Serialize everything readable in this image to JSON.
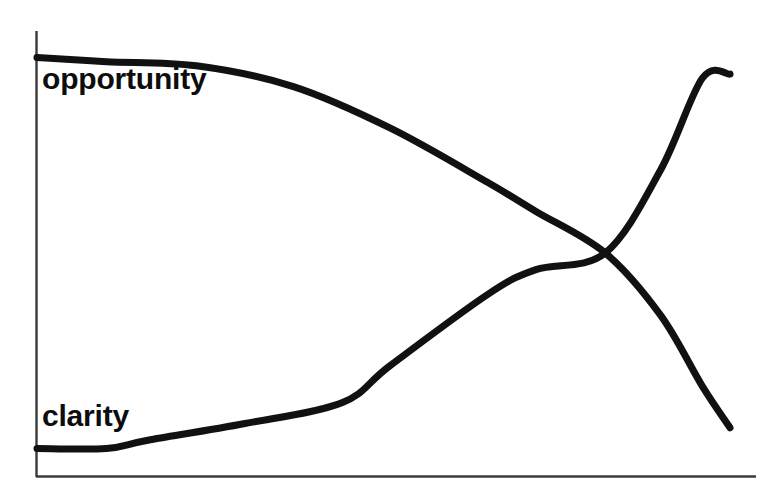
{
  "chart_data": {
    "type": "line",
    "title": "",
    "subtitle": "",
    "xlabel": "",
    "ylabel": "",
    "xlim": [
      0,
      100
    ],
    "ylim": [
      0,
      100
    ],
    "grid": false,
    "axes": {
      "x_axis_visible": true,
      "y_axis_visible": true,
      "tick_labels_x": [],
      "tick_labels_y": [],
      "axis_color": "#3a3a3a",
      "axis_width_px": 2
    },
    "legend": {
      "position": "inline-left",
      "entries": [
        "opportunity",
        "clarity"
      ]
    },
    "line_color": "#111111",
    "line_width_px": 7,
    "annotations": [
      {
        "name": "crossover-point",
        "x": 82,
        "y": 50,
        "label": ""
      }
    ],
    "series": [
      {
        "name": "opportunity",
        "label": "opportunity",
        "color": "#111111",
        "trend": "decreasing",
        "points": [
          {
            "x": 0,
            "y": 97
          },
          {
            "x": 10,
            "y": 96
          },
          {
            "x": 23,
            "y": 95
          },
          {
            "x": 37,
            "y": 90
          },
          {
            "x": 51,
            "y": 80
          },
          {
            "x": 65,
            "y": 67
          },
          {
            "x": 72,
            "y": 60
          },
          {
            "x": 82,
            "y": 50
          },
          {
            "x": 90,
            "y": 35
          },
          {
            "x": 96,
            "y": 18
          },
          {
            "x": 100,
            "y": 8
          }
        ]
      },
      {
        "name": "clarity",
        "label": "clarity",
        "color": "#111111",
        "trend": "increasing",
        "points": [
          {
            "x": 0,
            "y": 3
          },
          {
            "x": 10,
            "y": 3
          },
          {
            "x": 16,
            "y": 5
          },
          {
            "x": 30,
            "y": 9
          },
          {
            "x": 44,
            "y": 14
          },
          {
            "x": 51,
            "y": 23
          },
          {
            "x": 65,
            "y": 40
          },
          {
            "x": 72,
            "y": 46
          },
          {
            "x": 82,
            "y": 50
          },
          {
            "x": 90,
            "y": 70
          },
          {
            "x": 96,
            "y": 92
          },
          {
            "x": 100,
            "y": 93
          }
        ]
      }
    ]
  },
  "labels": {
    "opportunity": "opportunity",
    "clarity": "clarity"
  }
}
